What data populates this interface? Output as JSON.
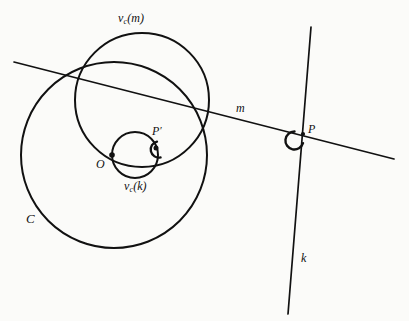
{
  "figure": {
    "type": "geometry-diagram",
    "background_color": "#fbfbf9",
    "ink_color": "#111111",
    "width": 409,
    "height": 321,
    "labels": {
      "circle_c": "C",
      "center_o": "O",
      "point_p": "P",
      "point_p_prime": "P",
      "prime_mark": "′",
      "line_m": "m",
      "line_k": "k",
      "image_of_m_prefix": "v",
      "image_of_m_subscript": "c",
      "image_of_m_open": "(",
      "image_of_m_arg": "m",
      "image_of_m_close": ")",
      "image_of_k_prefix": "v",
      "image_of_k_subscript": "c",
      "image_of_k_open": "(",
      "image_of_k_arg": "k",
      "image_of_k_close": ")"
    },
    "shapes": {
      "circle_c": {
        "cx": 114,
        "cy": 155,
        "r": 93,
        "stroke_width": 2.0
      },
      "circle_vc_m": {
        "cx": 142,
        "cy": 100,
        "r": 67,
        "stroke_width": 2.0
      },
      "circle_vc_k": {
        "cx": 135,
        "cy": 155,
        "r": 23,
        "stroke_width": 2.0
      },
      "line_m": {
        "x1": 14,
        "y1": 62,
        "x2": 394,
        "y2": 159,
        "stroke_width": 1.7
      },
      "line_k": {
        "x1": 311,
        "y1": 27,
        "x2": 288,
        "y2": 314,
        "stroke_width": 1.7
      },
      "angle_arc_p": {
        "cx": 303,
        "cy": 134,
        "r": 9,
        "stroke_width": 2.2
      },
      "angle_arc_p_prime": {
        "cx": 158,
        "cy": 152,
        "r": 7,
        "stroke_width": 2.2
      },
      "vertex_o": {
        "cx": 112,
        "cy": 155,
        "r": 2.6
      },
      "vertex_p": {
        "cx": 303,
        "cy": 134,
        "r": 2.2
      },
      "vertex_p_prime": {
        "cx": 156,
        "cy": 148,
        "r": 2.4
      }
    },
    "label_positions": {
      "circle_c": {
        "left": 26,
        "top": 212
      },
      "center_o": {
        "left": 96,
        "top": 158
      },
      "point_p": {
        "left": 308,
        "top": 123
      },
      "point_p_prime": {
        "left": 152,
        "top": 125
      },
      "line_m": {
        "left": 236,
        "top": 102
      },
      "line_k": {
        "left": 301,
        "top": 252
      },
      "image_of_m": {
        "left": 118,
        "top": 12
      },
      "image_of_k": {
        "left": 124,
        "top": 180
      }
    }
  }
}
